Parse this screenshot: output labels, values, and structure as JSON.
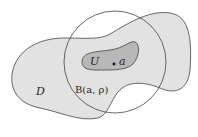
{
  "diagram": {
    "labels": {
      "domain": "D",
      "open_set": "U",
      "point": "a",
      "ball": "B(a, ρ)"
    },
    "colors": {
      "domain_fill": "#e2e2e2",
      "open_set_fill": "#b8b8b8",
      "stroke": "#444444"
    }
  }
}
